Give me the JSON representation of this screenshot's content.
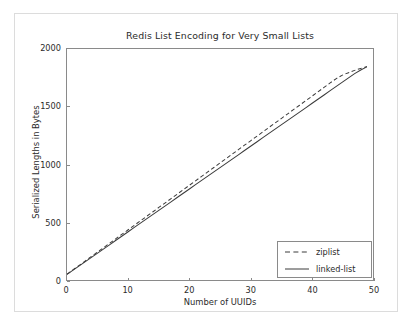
{
  "chart_data": {
    "type": "line",
    "title": "Redis List Encoding for Very Small Lists",
    "xlabel": "Number of UUIDs",
    "ylabel": "Serialized Lengths in Bytes",
    "xlim": [
      0,
      50
    ],
    "ylim": [
      0,
      2000
    ],
    "grid": false,
    "legend_position": "lower right",
    "xticks": [
      0,
      10,
      20,
      30,
      40,
      50
    ],
    "xtick_labels": [
      "0",
      "10",
      "20",
      "30",
      "40",
      "50"
    ],
    "yticks": [
      0,
      500,
      1000,
      1500,
      2000
    ],
    "ytick_labels": [
      "0",
      "500",
      "1000",
      "1500",
      "2000"
    ],
    "x": [
      0,
      1,
      2,
      3,
      4,
      5,
      6,
      7,
      8,
      9,
      10,
      11,
      12,
      13,
      14,
      15,
      16,
      17,
      18,
      19,
      20,
      21,
      22,
      23,
      24,
      25,
      26,
      27,
      28,
      29,
      30,
      31,
      32,
      33,
      34,
      35,
      36,
      37,
      38,
      39,
      40,
      41,
      42,
      43,
      44,
      45,
      46,
      47,
      48,
      49
    ],
    "series": [
      {
        "name": "ziplist",
        "style": "dashed",
        "color": "#3a3a3a",
        "values": [
          50,
          89,
          127,
          166,
          204,
          243,
          281,
          320,
          358,
          397,
          435,
          474,
          512,
          551,
          589,
          628,
          666,
          705,
          743,
          782,
          820,
          859,
          897,
          936,
          974,
          1013,
          1051,
          1090,
          1128,
          1167,
          1205,
          1244,
          1282,
          1321,
          1359,
          1398,
          1436,
          1475,
          1513,
          1552,
          1590,
          1629,
          1667,
          1706,
          1744,
          1774,
          1795,
          1815,
          1832,
          1848
        ]
      },
      {
        "name": "linked-list",
        "style": "solid",
        "color": "#3a3a3a",
        "values": [
          48,
          85,
          122,
          159,
          196,
          233,
          270,
          307,
          344,
          381,
          418,
          455,
          492,
          529,
          566,
          603,
          640,
          677,
          714,
          751,
          788,
          825,
          862,
          899,
          936,
          973,
          1010,
          1047,
          1084,
          1121,
          1158,
          1195,
          1232,
          1269,
          1306,
          1343,
          1380,
          1417,
          1454,
          1491,
          1528,
          1565,
          1602,
          1639,
          1676,
          1713,
          1750,
          1787,
          1818,
          1845
        ]
      }
    ],
    "legend_entries": [
      {
        "label": "ziplist",
        "style": "dashed"
      },
      {
        "label": "linked-list",
        "style": "solid"
      }
    ]
  }
}
